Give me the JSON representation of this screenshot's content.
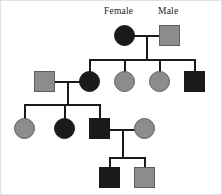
{
  "diagram": {
    "background_color": "#ffffff",
    "line_color": "#1a1a1a",
    "affected_fill": "#1a1a1a",
    "unaffected_fill": "#8c8c8c",
    "symbol_border_color": "#5e5e5e",
    "labels": [
      {
        "id": "female-label",
        "text": "Female",
        "x": 103,
        "y": 6
      },
      {
        "id": "male-label",
        "text": "Male",
        "x": 157,
        "y": 6
      }
    ],
    "symbols": [
      {
        "id": "gen1-female",
        "shape": "circle",
        "sex": "female",
        "fill": "black",
        "x": 113,
        "y": 24,
        "size": 21
      },
      {
        "id": "gen1-male",
        "shape": "square",
        "sex": "male",
        "fill": "gray",
        "x": 158,
        "y": 24,
        "size": 21
      },
      {
        "id": "gen2-spouse-male",
        "shape": "square",
        "sex": "male",
        "fill": "gray",
        "x": 33,
        "y": 70,
        "size": 21
      },
      {
        "id": "gen2-child1-female",
        "shape": "circle",
        "sex": "female",
        "fill": "black",
        "x": 78,
        "y": 70,
        "size": 21
      },
      {
        "id": "gen2-child2-female",
        "shape": "circle",
        "sex": "female",
        "fill": "gray",
        "x": 113,
        "y": 70,
        "size": 21
      },
      {
        "id": "gen2-child3-female",
        "shape": "circle",
        "sex": "female",
        "fill": "gray",
        "x": 148,
        "y": 70,
        "size": 21
      },
      {
        "id": "gen2-child4-male",
        "shape": "square",
        "sex": "male",
        "fill": "black",
        "x": 183,
        "y": 70,
        "size": 21
      },
      {
        "id": "gen3-child1-female",
        "shape": "circle",
        "sex": "female",
        "fill": "gray",
        "x": 13,
        "y": 117,
        "size": 21
      },
      {
        "id": "gen3-child2-female",
        "shape": "circle",
        "sex": "female",
        "fill": "black",
        "x": 53,
        "y": 117,
        "size": 21
      },
      {
        "id": "gen3-child3-male",
        "shape": "square",
        "sex": "male",
        "fill": "black",
        "x": 88,
        "y": 117,
        "size": 21
      },
      {
        "id": "gen3-spouse-female",
        "shape": "circle",
        "sex": "female",
        "fill": "gray",
        "x": 133,
        "y": 117,
        "size": 21
      },
      {
        "id": "gen4-child1-male",
        "shape": "square",
        "sex": "male",
        "fill": "black",
        "x": 98,
        "y": 166,
        "size": 21
      },
      {
        "id": "gen4-child2-male",
        "shape": "square",
        "sex": "male",
        "fill": "gray",
        "x": 133,
        "y": 166,
        "size": 21
      }
    ],
    "connectors": [
      {
        "id": "gen1-mating-line",
        "orient": "h",
        "x": 133,
        "y": 34,
        "length": 25
      },
      {
        "id": "gen1-descent-line",
        "orient": "v",
        "x": 145,
        "y": 34,
        "length": 24
      },
      {
        "id": "gen2-sibship-line",
        "orient": "h",
        "x": 88,
        "y": 58,
        "length": 106
      },
      {
        "id": "gen2-drop-child1",
        "orient": "v",
        "x": 88,
        "y": 58,
        "length": 13
      },
      {
        "id": "gen2-drop-child2",
        "orient": "v",
        "x": 123,
        "y": 58,
        "length": 13
      },
      {
        "id": "gen2-drop-child3",
        "orient": "v",
        "x": 158,
        "y": 58,
        "length": 13
      },
      {
        "id": "gen2-drop-child4",
        "orient": "v",
        "x": 193,
        "y": 58,
        "length": 13
      },
      {
        "id": "gen2-mating-line",
        "orient": "h",
        "x": 54,
        "y": 80,
        "length": 25
      },
      {
        "id": "gen2-descent-line",
        "orient": "v",
        "x": 66,
        "y": 80,
        "length": 24
      },
      {
        "id": "gen3-sibship-line",
        "orient": "h",
        "x": 23,
        "y": 103,
        "length": 76
      },
      {
        "id": "gen3-drop-child1",
        "orient": "v",
        "x": 23,
        "y": 103,
        "length": 15
      },
      {
        "id": "gen3-drop-child2",
        "orient": "v",
        "x": 63,
        "y": 103,
        "length": 15
      },
      {
        "id": "gen3-drop-child3",
        "orient": "v",
        "x": 98,
        "y": 103,
        "length": 15
      },
      {
        "id": "gen3-mating-line",
        "orient": "h",
        "x": 109,
        "y": 128,
        "length": 25
      },
      {
        "id": "gen3-descent-line",
        "orient": "v",
        "x": 121,
        "y": 128,
        "length": 29
      },
      {
        "id": "gen4-sibship-line",
        "orient": "h",
        "x": 108,
        "y": 156,
        "length": 36
      },
      {
        "id": "gen4-drop-child1",
        "orient": "v",
        "x": 108,
        "y": 156,
        "length": 11
      },
      {
        "id": "gen4-drop-child2",
        "orient": "v",
        "x": 143,
        "y": 156,
        "length": 11
      }
    ]
  }
}
